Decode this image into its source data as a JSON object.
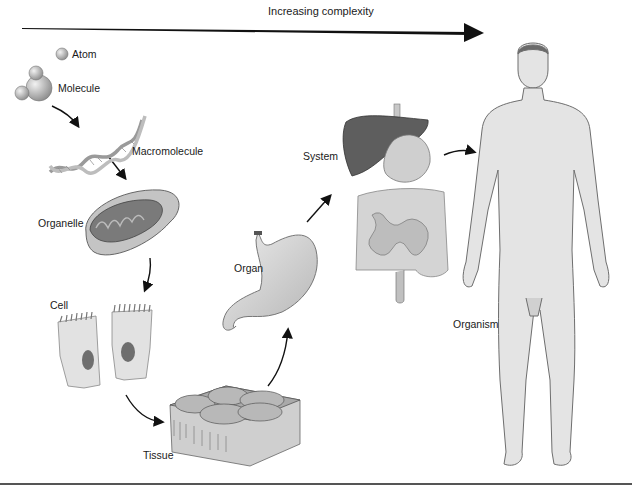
{
  "header": {
    "arrow_label": "Increasing complexity"
  },
  "levels": [
    {
      "id": "atom",
      "label": "Atom"
    },
    {
      "id": "molecule",
      "label": "Molecule"
    },
    {
      "id": "macromolecule",
      "label": "Macromolecule"
    },
    {
      "id": "organelle",
      "label": "Organelle"
    },
    {
      "id": "cell",
      "label": "Cell"
    },
    {
      "id": "tissue",
      "label": "Tissue"
    },
    {
      "id": "organ",
      "label": "Organ"
    },
    {
      "id": "system",
      "label": "System"
    },
    {
      "id": "organism",
      "label": "Organism"
    }
  ],
  "colors": {
    "ink": "#1a1a1a",
    "fill_light": "#d9d9d9",
    "fill_mid": "#a8a8a8",
    "fill_dark": "#555555",
    "skin": "#e6e6e6"
  }
}
